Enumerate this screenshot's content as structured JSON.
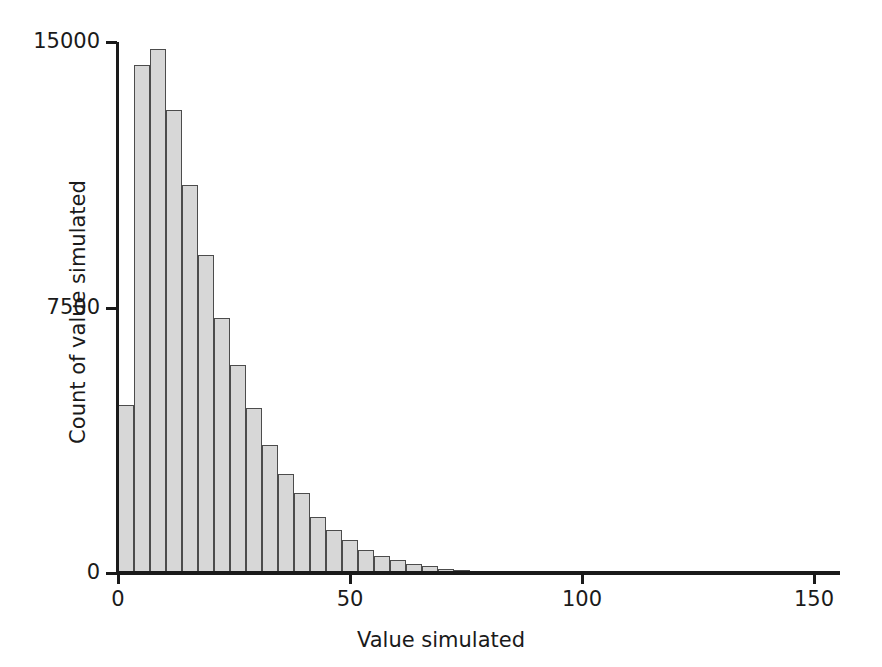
{
  "chart_data": {
    "type": "bar",
    "title": "",
    "subtitle": "",
    "xlabel": "Value simulated",
    "ylabel": "Count of value simulated",
    "xlim": [
      0,
      157
    ],
    "ylim": [
      0,
      15000
    ],
    "xticks": [
      0,
      50,
      100,
      150
    ],
    "xtick_labels": [
      "0",
      "50",
      "100",
      "150"
    ],
    "yticks": [
      0,
      7500,
      15000
    ],
    "ytick_labels": [
      "0",
      "7500",
      "15000"
    ],
    "grid": false,
    "legend": null,
    "bar_fill_color": "#d7d7d7",
    "bar_edge_color": "#4c4c4c",
    "axis_color": "#1a1a1a",
    "bin_width": 3.45,
    "bin_starts": [
      0,
      3.45,
      6.9,
      10.35,
      13.8,
      17.25,
      20.7,
      24.15,
      27.6,
      31.05,
      34.5,
      37.95,
      41.4,
      44.85,
      48.3,
      51.75,
      55.2,
      58.65,
      62.1,
      65.55,
      69.0,
      72.45,
      75.9
    ],
    "bin_centers": [
      1.7,
      5.2,
      8.6,
      12.1,
      15.5,
      19.0,
      22.4,
      25.9,
      29.3,
      32.8,
      36.2,
      39.7,
      43.1,
      46.6,
      50.0,
      53.5,
      56.9,
      60.4,
      63.8,
      67.3,
      70.7,
      74.2,
      77.6
    ],
    "categories": [
      "0-3.5",
      "3.5-6.9",
      "6.9-10.4",
      "10.4-13.8",
      "13.8-17.3",
      "17.3-20.7",
      "20.7-24.2",
      "24.2-27.6",
      "27.6-31.1",
      "31.1-34.5",
      "34.5-38.0",
      "38.0-41.4",
      "41.4-44.9",
      "44.9-48.3",
      "48.3-51.8",
      "51.8-55.2",
      "55.2-58.7",
      "58.7-62.1",
      "62.1-65.6",
      "65.6-69.0",
      "69.0-72.5",
      "72.5-75.9",
      "75.9-79.4"
    ],
    "values": [
      4740,
      14360,
      14790,
      13090,
      10970,
      8970,
      7190,
      5870,
      4660,
      3610,
      2800,
      2260,
      1580,
      1220,
      930,
      650,
      480,
      360,
      260,
      190,
      120,
      80,
      40
    ],
    "series": [
      {
        "name": "Count of value simulated",
        "values": [
          4740,
          14360,
          14790,
          13090,
          10970,
          8970,
          7190,
          5870,
          4660,
          3610,
          2800,
          2260,
          1580,
          1220,
          930,
          650,
          480,
          360,
          260,
          190,
          120,
          80,
          40
        ]
      }
    ]
  }
}
